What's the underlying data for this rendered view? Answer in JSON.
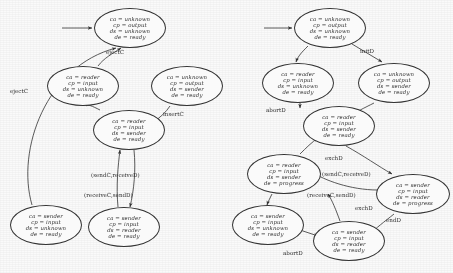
{
  "figure": {
    "variable_names": [
      "ca",
      "cp",
      "ds",
      "de"
    ]
  },
  "left_diagram": {
    "name": "left-automaton",
    "nodes": [
      {
        "id": "L1",
        "name": "state-ca-unknown-cp-output-ds-unknown-de-ready",
        "lines": [
          "ca = unknown",
          "cp = output",
          "ds = unknown",
          "de = ready"
        ],
        "x": 94,
        "y": 8,
        "w": 72,
        "h": 40,
        "initial": true
      },
      {
        "id": "L2",
        "name": "state-ca-reader-cp-input-ds-unknown-de-ready",
        "lines": [
          "ca = reader",
          "cp = input",
          "ds = unknown",
          "de = ready"
        ],
        "x": 47,
        "y": 66,
        "w": 72,
        "h": 40,
        "initial": false
      },
      {
        "id": "L3",
        "name": "state-ca-unknown-cp-output-ds-sender-de-ready",
        "lines": [
          "ca = unknown",
          "cp = output",
          "ds = sender",
          "de = ready"
        ],
        "x": 151,
        "y": 66,
        "w": 72,
        "h": 40,
        "initial": false
      },
      {
        "id": "L4",
        "name": "state-ca-reader-cp-input-ds-sender-de-ready",
        "lines": [
          "ca = reader",
          "cp = input",
          "ds = sender",
          "de = ready"
        ],
        "x": 93,
        "y": 110,
        "w": 72,
        "h": 40,
        "initial": false
      },
      {
        "id": "L5",
        "name": "state-ca-sender-cp-input-ds-unknown-de-ready",
        "lines": [
          "ca = sender",
          "cp = input",
          "ds = unknown",
          "de = ready"
        ],
        "x": 10,
        "y": 205,
        "w": 72,
        "h": 40,
        "initial": false
      },
      {
        "id": "L6",
        "name": "state-ca-sender-cp-input-ds-reader-de-ready",
        "lines": [
          "ca = sender",
          "cp = input",
          "ds = reader",
          "de = ready"
        ],
        "x": 88,
        "y": 207,
        "w": 72,
        "h": 40,
        "initial": false
      }
    ],
    "edge_labels": [
      {
        "name": "edge-label-ejectc-upper",
        "text": "ejectC",
        "x": 106,
        "y": 49
      },
      {
        "name": "edge-label-ejectc-lower",
        "text": "ejectC",
        "x": 10,
        "y": 88
      },
      {
        "name": "edge-label-insertc",
        "text": "insertC",
        "x": 163,
        "y": 111
      },
      {
        "name": "edge-label-sendc-received",
        "text": "(sendC,receiveD)",
        "x": 91,
        "y": 172
      },
      {
        "name": "edge-label-receivec-sendd",
        "text": "(receiveC,sendD)",
        "x": 84,
        "y": 192
      }
    ]
  },
  "right_diagram": {
    "name": "right-automaton",
    "nodes": [
      {
        "id": "R1",
        "name": "state-ca-unknown-cp-output-ds-unknown-de-ready",
        "lines": [
          "ca = unknown",
          "cp = output",
          "ds = unknown",
          "de = ready"
        ],
        "x": 294,
        "y": 8,
        "w": 72,
        "h": 40,
        "initial": true
      },
      {
        "id": "R2",
        "name": "state-ca-reader-cp-input-ds-unknown-de-ready",
        "lines": [
          "ca = reader",
          "cp = input",
          "ds = unknown",
          "de = ready"
        ],
        "x": 262,
        "y": 63,
        "w": 72,
        "h": 40,
        "initial": false
      },
      {
        "id": "R3",
        "name": "state-ca-unknown-cp-output-ds-sender-de-ready",
        "lines": [
          "ca = unknown",
          "cp = output",
          "ds = sender",
          "de = ready"
        ],
        "x": 358,
        "y": 63,
        "w": 72,
        "h": 40,
        "initial": false
      },
      {
        "id": "R4",
        "name": "state-ca-reader-cp-input-ds-sender-de-ready",
        "lines": [
          "ca = reader",
          "cp = input",
          "ds = sender",
          "de = ready"
        ],
        "x": 303,
        "y": 106,
        "w": 72,
        "h": 40,
        "initial": false
      },
      {
        "id": "R5",
        "name": "state-ca-reader-cp-input-ds-sender-de-progress",
        "lines": [
          "ca = reader",
          "cp = input",
          "ds = sender",
          "de = progress"
        ],
        "x": 247,
        "y": 154,
        "w": 74,
        "h": 40,
        "initial": false
      },
      {
        "id": "R6",
        "name": "state-ca-sender-cp-input-ds-reader-de-progress",
        "lines": [
          "ca = sender",
          "cp = input",
          "ds = reader",
          "de = progress"
        ],
        "x": 376,
        "y": 174,
        "w": 74,
        "h": 40,
        "initial": false
      },
      {
        "id": "R7",
        "name": "state-ca-sender-cp-input-ds-unknown-de-ready",
        "lines": [
          "ca = sender",
          "cp = input",
          "ds = unknown",
          "de = ready"
        ],
        "x": 232,
        "y": 205,
        "w": 72,
        "h": 40,
        "initial": false
      },
      {
        "id": "R8",
        "name": "state-ca-sender-cp-input-ds-reader-de-ready",
        "lines": [
          "ca = sender",
          "cp = input",
          "ds = reader",
          "de = ready"
        ],
        "x": 313,
        "y": 221,
        "w": 72,
        "h": 40,
        "initial": false
      }
    ],
    "edge_labels": [
      {
        "name": "edge-label-initd",
        "text": "initD",
        "x": 360,
        "y": 48
      },
      {
        "name": "edge-label-abortd-upper",
        "text": "abortD",
        "x": 266,
        "y": 107
      },
      {
        "name": "edge-label-exchd-upper",
        "text": "exchD",
        "x": 325,
        "y": 155
      },
      {
        "name": "edge-label-endd",
        "text": "endD",
        "x": 386,
        "y": 217
      },
      {
        "name": "edge-label-exchd-lower",
        "text": "exchD",
        "x": 355,
        "y": 205
      },
      {
        "name": "edge-label-sendc-received",
        "text": "(sendC,receiveD)",
        "x": 322,
        "y": 171
      },
      {
        "name": "edge-label-receivec-sendd",
        "text": "(receiveC,sendD)",
        "x": 307,
        "y": 192
      },
      {
        "name": "edge-label-abortd-lower",
        "text": "abortD",
        "x": 283,
        "y": 250
      }
    ]
  }
}
